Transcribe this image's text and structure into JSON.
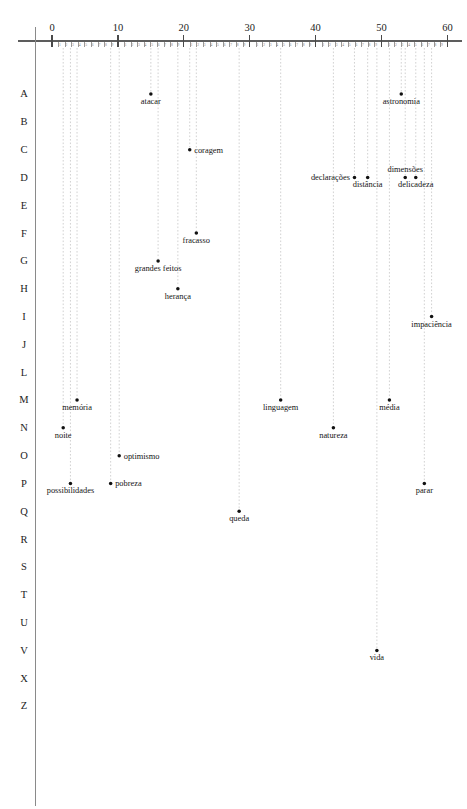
{
  "chart_data": {
    "type": "scatter",
    "title": "",
    "subtitle": "",
    "xlabel": "",
    "ylabel": "",
    "xlim": [
      -2,
      62
    ],
    "ylim_categories": [
      "A",
      "B",
      "C",
      "D",
      "E",
      "F",
      "G",
      "H",
      "I",
      "J",
      "L",
      "M",
      "N",
      "O",
      "P",
      "Q",
      "R",
      "S",
      "T",
      "U",
      "V",
      "X",
      "Z"
    ],
    "grid": false,
    "legend": null,
    "x_axis": {
      "major_ticks": [
        0,
        10,
        20,
        30,
        40,
        50,
        60
      ],
      "major_tick_labels": [
        "0",
        "10",
        "20",
        "30",
        "40",
        "50",
        "60"
      ],
      "minor_tick_labels": [
        "1",
        "2",
        "3",
        "4",
        "5",
        "6",
        "7",
        "8",
        "9"
      ],
      "minor_tick_step": 1,
      "position": "top"
    },
    "y_axis": {
      "categories": [
        "A",
        "B",
        "C",
        "D",
        "E",
        "F",
        "G",
        "H",
        "I",
        "J",
        "L",
        "M",
        "N",
        "O",
        "P",
        "Q",
        "R",
        "S",
        "T",
        "U",
        "V",
        "X",
        "Z"
      ],
      "position": "left",
      "note": "Portuguese alphabet ordering: no K, W or Y"
    },
    "points": [
      {
        "label": "atacar",
        "row": "A",
        "x": 15.0,
        "label_anchor": "middle",
        "label_side": "below"
      },
      {
        "label": "astronomia",
        "row": "A",
        "x": 53.0,
        "label_anchor": "middle",
        "label_side": "below"
      },
      {
        "label": "coragem",
        "row": "C",
        "x": 20.9,
        "label_anchor": "start",
        "label_side": "right"
      },
      {
        "label": "declarações",
        "row": "D",
        "x": 45.9,
        "label_anchor": "end",
        "label_side": "left"
      },
      {
        "label": "dimensões",
        "row": "D",
        "x": 53.6,
        "label_anchor": "middle",
        "label_side": "above"
      },
      {
        "label": "distância",
        "row": "D",
        "x": 47.9,
        "label_anchor": "middle",
        "label_side": "below"
      },
      {
        "label": "delicadeza",
        "row": "D",
        "x": 55.2,
        "label_anchor": "middle",
        "label_side": "below"
      },
      {
        "label": "fracasso",
        "row": "F",
        "x": 21.9,
        "label_anchor": "middle",
        "label_side": "below"
      },
      {
        "label": "grandes feitos",
        "row": "G",
        "x": 16.1,
        "label_anchor": "middle",
        "label_side": "below"
      },
      {
        "label": "herança",
        "row": "H",
        "x": 19.1,
        "label_anchor": "middle",
        "label_side": "below"
      },
      {
        "label": "impaciência",
        "row": "I",
        "x": 57.6,
        "label_anchor": "middle",
        "label_side": "below"
      },
      {
        "label": "linguagem",
        "row": "M",
        "x": 34.7,
        "label_anchor": "middle",
        "label_side": "below"
      },
      {
        "label": "memória",
        "row": "M",
        "x": 3.8,
        "label_anchor": "middle",
        "label_side": "below"
      },
      {
        "label": "média",
        "row": "M",
        "x": 51.2,
        "label_anchor": "middle",
        "label_side": "below"
      },
      {
        "label": "natureza",
        "row": "N",
        "x": 42.7,
        "label_anchor": "middle",
        "label_side": "below"
      },
      {
        "label": "noite",
        "row": "N",
        "x": 1.7,
        "label_anchor": "middle",
        "label_side": "below"
      },
      {
        "label": "optimismo",
        "row": "O",
        "x": 10.2,
        "label_anchor": "start",
        "label_side": "right"
      },
      {
        "label": "pobreza",
        "row": "P",
        "x": 8.9,
        "label_anchor": "start",
        "label_side": "right"
      },
      {
        "label": "possibilidades",
        "row": "P",
        "x": 2.8,
        "label_anchor": "middle",
        "label_side": "below"
      },
      {
        "label": "parar",
        "row": "P",
        "x": 56.5,
        "label_anchor": "middle",
        "label_side": "below"
      },
      {
        "label": "queda",
        "row": "Q",
        "x": 28.4,
        "label_anchor": "middle",
        "label_side": "below"
      },
      {
        "label": "vida",
        "row": "V",
        "x": 49.3,
        "label_anchor": "middle",
        "label_side": "below"
      }
    ],
    "colors": {
      "dot": "#111111",
      "axis": "#5d5d5d",
      "leader": "#b9b9b9",
      "text": "#1a1a1a",
      "background": "#ffffff"
    }
  }
}
